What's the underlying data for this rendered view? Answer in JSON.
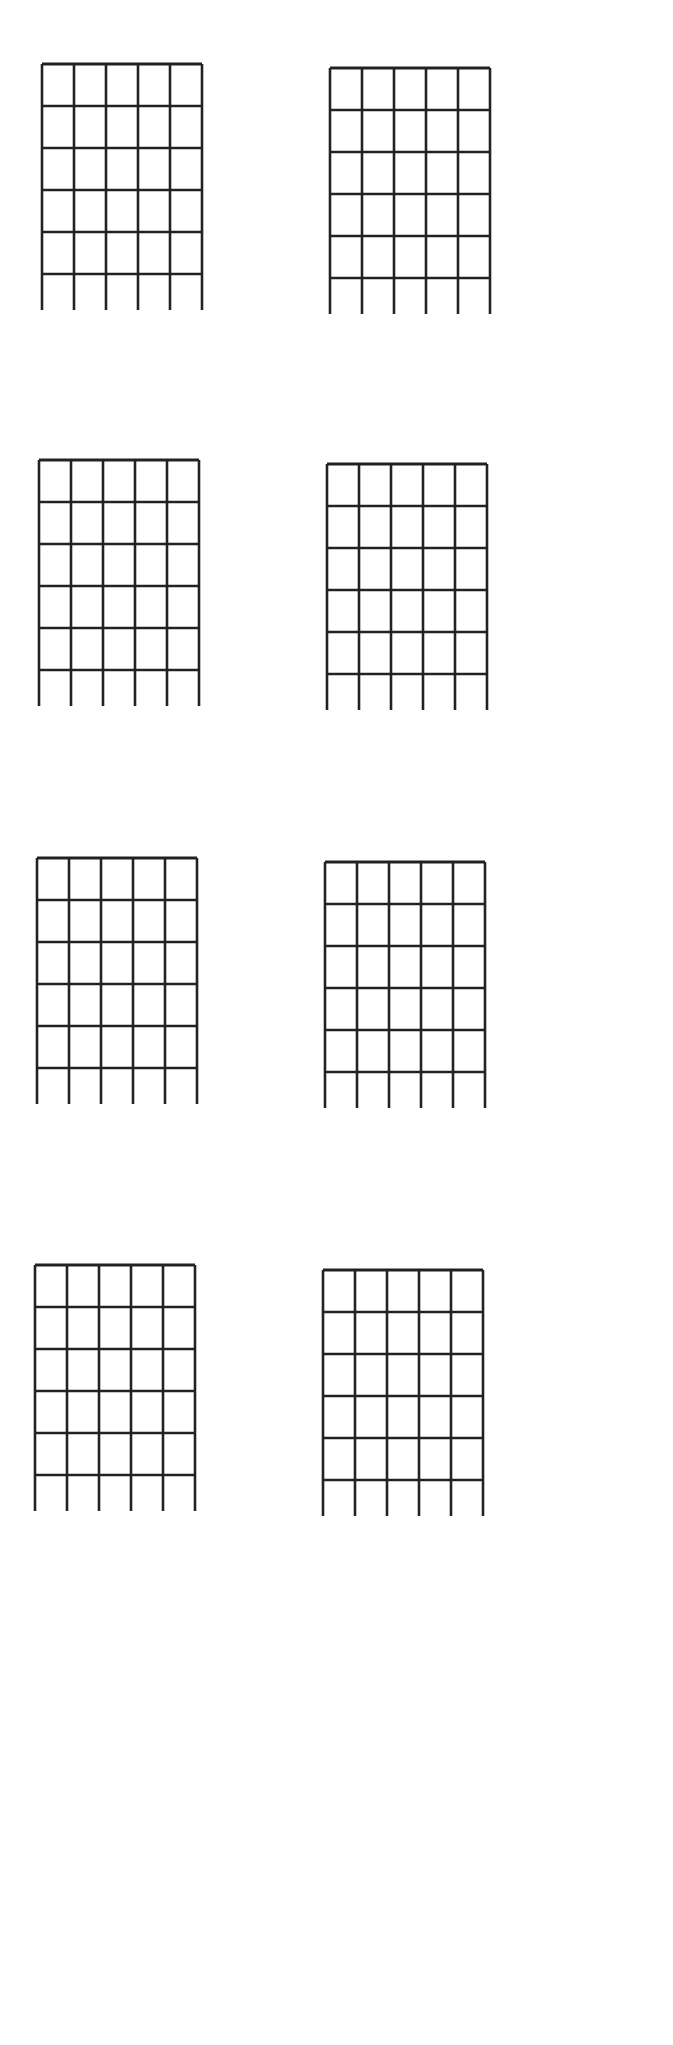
{
  "page": {
    "type": "blank guitar chord diagram sheet",
    "background": "#ffffff",
    "line_color": "#222222"
  },
  "diagram_spec": {
    "strings": 6,
    "frets": 5,
    "width": 160,
    "grid_height": 210,
    "string_tail": 36
  },
  "diagrams": [
    {
      "id": "chord-1",
      "x": 40,
      "y": 62
    },
    {
      "id": "chord-2",
      "x": 328,
      "y": 66
    },
    {
      "id": "chord-3",
      "x": 37,
      "y": 458
    },
    {
      "id": "chord-4",
      "x": 325,
      "y": 462
    },
    {
      "id": "chord-5",
      "x": 35,
      "y": 856
    },
    {
      "id": "chord-6",
      "x": 323,
      "y": 860
    },
    {
      "id": "chord-7",
      "x": 33,
      "y": 1263
    },
    {
      "id": "chord-8",
      "x": 321,
      "y": 1268
    }
  ]
}
